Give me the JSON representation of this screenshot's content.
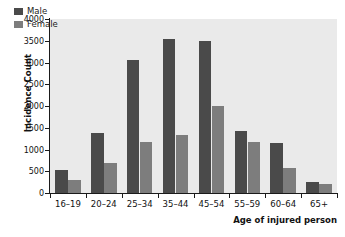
{
  "chart_data": {
    "type": "bar",
    "title": "",
    "subtitle": "",
    "xlabel": "Age of injured person",
    "ylabel": "Incidence Count",
    "categories": [
      "16–19",
      "20–24",
      "25–34",
      "35–44",
      "45–54",
      "55–59",
      "60–64",
      "65+"
    ],
    "series": [
      {
        "name": "Male",
        "color": "#4a4a4a",
        "values": [
          540,
          1370,
          3050,
          3540,
          3490,
          1430,
          1160,
          250
        ]
      },
      {
        "name": "Female",
        "color": "#7d7d7d",
        "values": [
          300,
          690,
          1180,
          1340,
          2010,
          1180,
          580,
          210
        ]
      }
    ],
    "ylim": [
      0,
      4000
    ],
    "yticks": [
      0,
      500,
      1000,
      1500,
      2000,
      2500,
      3000,
      3500,
      4000
    ],
    "ytick_labels": [
      "0",
      "500",
      "1000",
      "1500",
      "2000",
      "2500",
      "3000",
      "3500",
      "4000"
    ],
    "grid": false,
    "legend_position": "top-left-inside",
    "panel_background": "#eaeaea",
    "figure_background": "#ffffff",
    "axis_color": "#1a1a1a"
  },
  "legend": {
    "items": [
      {
        "label": "Male"
      },
      {
        "label": "Female"
      }
    ]
  }
}
